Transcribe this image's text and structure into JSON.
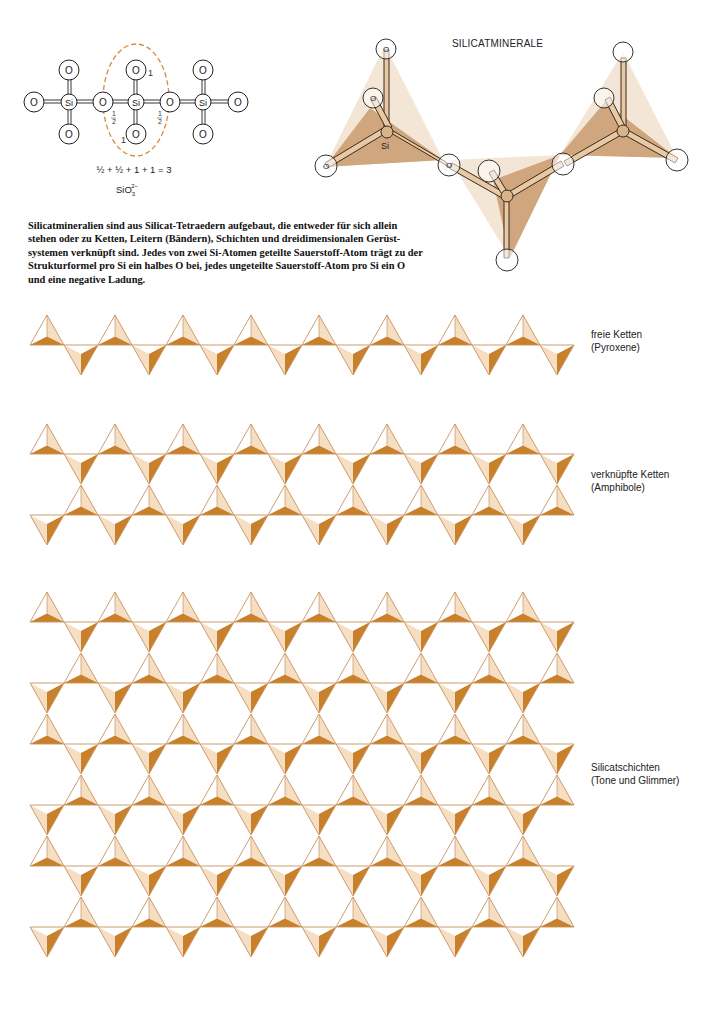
{
  "figure_title": "SILICATMINERALE",
  "top_left_diagram": {
    "atoms": {
      "si_label": "Si",
      "o_label": "O"
    },
    "annotations": {
      "half_left": "1/2",
      "half_right": "1/2",
      "one_top": "1",
      "one_bottom": "1"
    },
    "equation": "½ + ½ + 1 + 1 = 3",
    "formula": {
      "base": "SiO",
      "subscript": "3",
      "superscript": "2−"
    }
  },
  "structure_3d": {
    "si_label": "Si",
    "o_label": "O"
  },
  "caption": {
    "lines": [
      "Silicatmineralien sind aus Silicat-Tetraedern aufgebaut, die entweder für sich allein",
      "stehen oder zu Ketten, Leitern (Bändern), Schichten und dreidimensionalen Gerüst-",
      "systemen verknüpft sind. Jedes von zwei Si-Atomen geteilte Sauerstoff-Atom trägt zu der",
      "Strukturformel pro Si ein halbes O bei, jedes ungeteilte Sauerstoff-Atom pro Si ein O",
      "und eine negative Ladung."
    ]
  },
  "sections": [
    {
      "id": "single-chain",
      "label_line1": "freie Ketten",
      "label_line2": "(Pyroxene)",
      "rows": 1,
      "start_y": 345
    },
    {
      "id": "double-chain",
      "label_line1": "verknüpfte Ketten",
      "label_line2": "(Amphibole)",
      "rows": 2,
      "start_y": 454
    },
    {
      "id": "sheet",
      "label_line1": "Silicatschichten",
      "label_line2": "(Tone und Glimmer)",
      "rows": 6,
      "start_y": 622
    }
  ],
  "pattern": {
    "start_x": 30,
    "period_x": 68,
    "count": 8,
    "half_height": 30,
    "row_spacing": 61
  },
  "colors": {
    "dark_face": "#C8802A",
    "light_face": "#F6DEC3",
    "edge": "#C8925E",
    "tetra_3d_dark": "#C99A6E",
    "tetra_3d_light": "#EFDCC6",
    "ring_dashed": "#D88A3A"
  }
}
